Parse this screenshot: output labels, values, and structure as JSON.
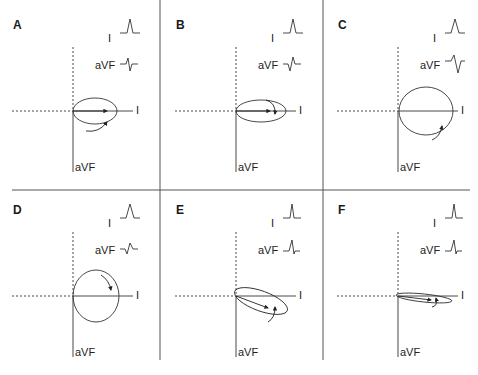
{
  "figure": {
    "colors": {
      "line": "#333333",
      "divider": "#555555",
      "background": "#ffffff"
    },
    "axis_labels": {
      "horizontal": "I",
      "vertical": "aVF"
    },
    "lead_labels": {
      "lead1": "I",
      "leadAVF": "aVF"
    },
    "panels": [
      {
        "id": "A",
        "label": "A",
        "origin": [
          73,
          111
        ],
        "loop": {
          "rx": 22,
          "ry": 13,
          "cx": 22,
          "cy": 0,
          "rot": 0
        },
        "vector": [
          34,
          0
        ],
        "rotation": "counterclockwise",
        "lead1_complex": "tall positive R",
        "aVF_complex": "small r, deep S (RS)"
      },
      {
        "id": "B",
        "label": "B",
        "origin": [
          236,
          111
        ],
        "loop": {
          "rx": 25,
          "ry": 11,
          "cx": 25,
          "cy": 0,
          "rot": 0
        },
        "vector": [
          34,
          0
        ],
        "rotation": "clockwise",
        "aVF_complex": "Q then R (qR)",
        "lead1_complex": "tall positive R"
      },
      {
        "id": "C",
        "label": "C",
        "origin": [
          398,
          111
        ],
        "loop": {
          "rx": 27,
          "ry": 24,
          "cx": 28,
          "cy": 0,
          "rot": 0
        },
        "vector": null,
        "rotation": "counterclockwise",
        "lead1_complex": "wide positive R",
        "aVF_complex": "R then deep S (RS)"
      },
      {
        "id": "D",
        "label": "D",
        "origin": [
          73,
          296
        ],
        "loop": {
          "rx": 23,
          "ry": 26,
          "cx": 23,
          "cy": 0,
          "rot": 0
        },
        "vector": null,
        "rotation": "clockwise",
        "lead1_complex": "positive R",
        "aVF_complex": "small q/S then r (qr)"
      },
      {
        "id": "E",
        "label": "E",
        "origin": [
          236,
          296
        ],
        "loop": {
          "rx": 28,
          "ry": 10,
          "cx": 25,
          "cy": 5,
          "rot": 20
        },
        "vector": [
          32,
          12
        ],
        "rotation": "clockwise",
        "lead1_complex": "tall narrow R",
        "aVF_complex": "R with small s (Rs)"
      },
      {
        "id": "F",
        "label": "F",
        "origin": [
          398,
          296
        ],
        "loop": {
          "rx": 28,
          "ry": 4,
          "cx": 26,
          "cy": 2,
          "rot": 6
        },
        "vector": [
          33,
          4
        ],
        "rotation": "clockwise",
        "lead1_complex": "tall narrow R",
        "aVF_complex": "R with small s (Rs)"
      }
    ]
  }
}
